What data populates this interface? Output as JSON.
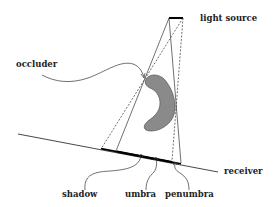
{
  "labels": {
    "light_source": "light source",
    "occluder": "occluder",
    "receiver": "receiver",
    "shadow": "shadow",
    "umbra": "umbra",
    "penumbra": "penumbra"
  },
  "colors": {
    "line": "#333333",
    "occluder_fill": "#8a8a8a",
    "shadow_bar": "#000000",
    "background": "#ffffff"
  }
}
